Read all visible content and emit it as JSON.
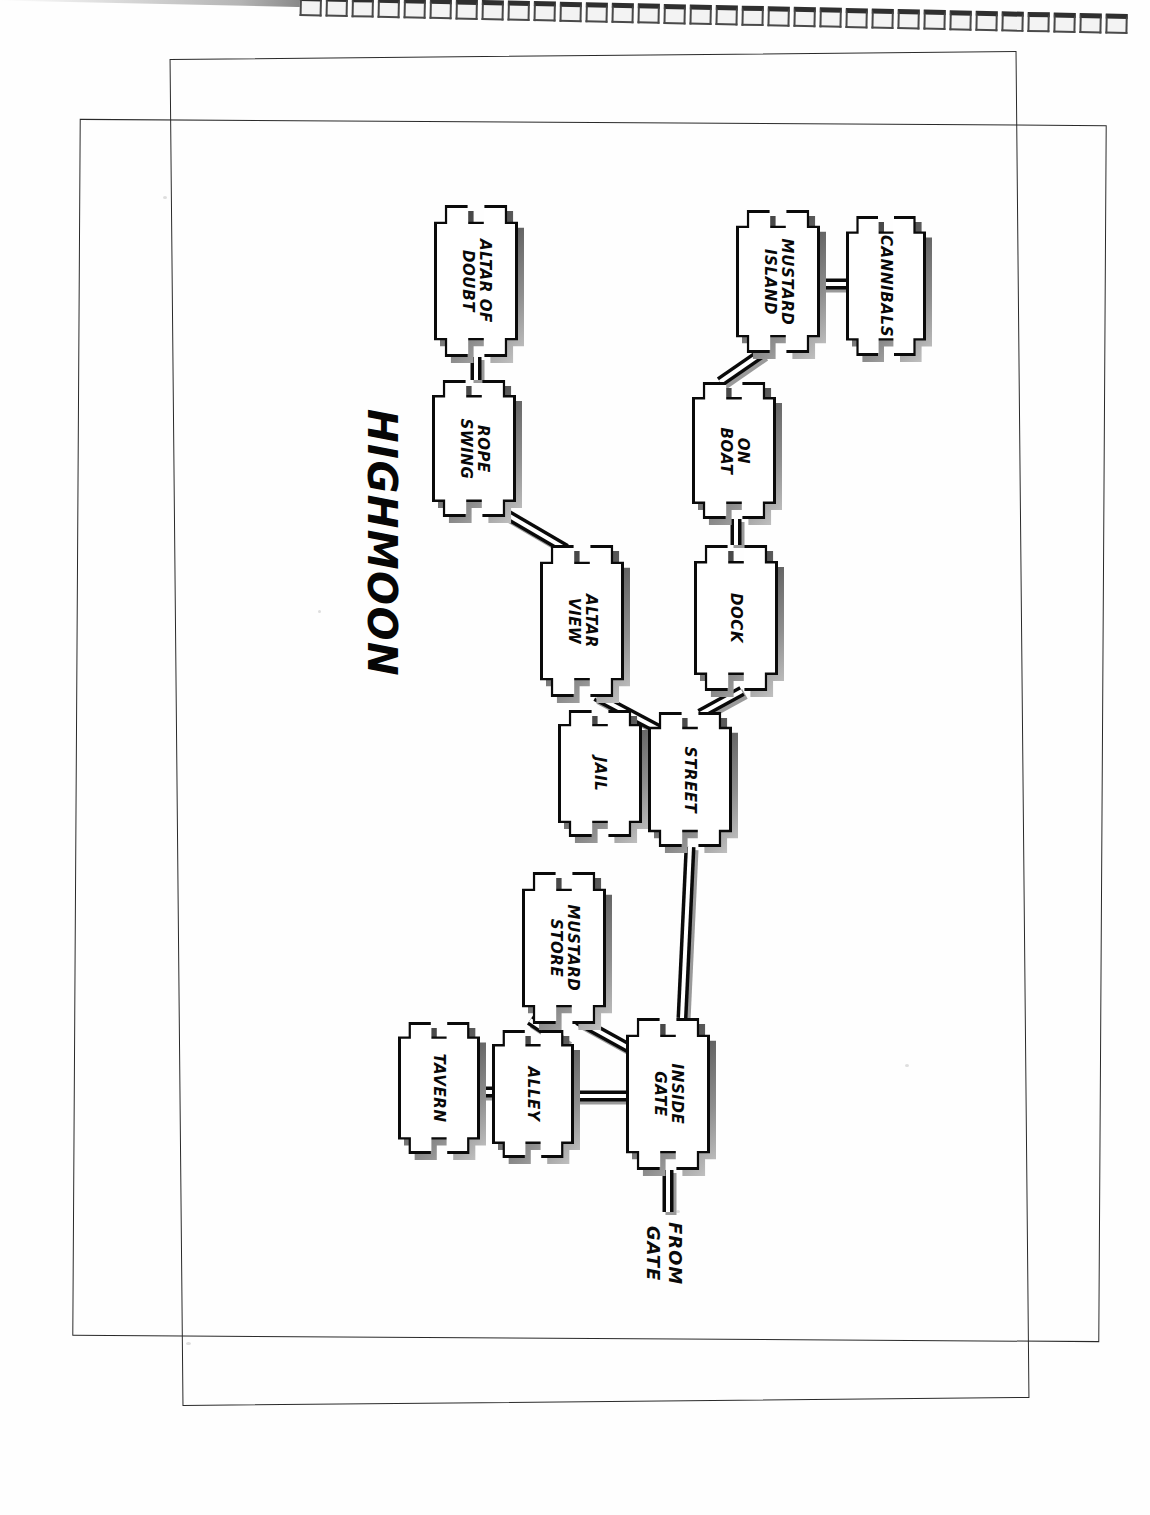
{
  "document": {
    "title": "HIGHMOON",
    "kind": "hand-drawn location map (scanned page, rotated 90 degrees)"
  },
  "map": {
    "title": "HIGHMOON",
    "entry_label": "FROM\nGATE",
    "entry_label_line1": "FROM",
    "entry_label_line2": "GATE",
    "nodes": [
      {
        "id": "altar-of-doubt",
        "label": "ALTAR OF DOUBT",
        "line1": "ALTAR OF",
        "line2": "DOUBT",
        "x": 434,
        "y": 205,
        "w": 84,
        "h": 152
      },
      {
        "id": "rope-swing",
        "label": "ROPE SWING",
        "line1": "ROPE",
        "line2": "SWING",
        "x": 432,
        "y": 380,
        "w": 84,
        "h": 137
      },
      {
        "id": "altar-view",
        "label": "ALTAR VIEW",
        "line1": "ALTAR",
        "line2": "VIEW",
        "x": 540,
        "y": 545,
        "w": 84,
        "h": 152
      },
      {
        "id": "jail",
        "label": "JAIL",
        "line1": "JAIL",
        "line2": "",
        "x": 558,
        "y": 710,
        "w": 84,
        "h": 127
      },
      {
        "id": "street",
        "label": "STREET",
        "line1": "STREET",
        "line2": "",
        "x": 648,
        "y": 712,
        "w": 84,
        "h": 135
      },
      {
        "id": "dock",
        "label": "DOCK",
        "line1": "DOCK",
        "line2": "",
        "x": 694,
        "y": 545,
        "w": 84,
        "h": 146
      },
      {
        "id": "on-boat",
        "label": "ON BOAT",
        "line1": "ON",
        "line2": "BOAT",
        "x": 692,
        "y": 382,
        "w": 84,
        "h": 137
      },
      {
        "id": "mustard-island",
        "label": "MUSTARD ISLAND",
        "line1": "MUSTARD",
        "line2": "ISLAND",
        "x": 736,
        "y": 210,
        "w": 84,
        "h": 143
      },
      {
        "id": "cannibals",
        "label": "CANNIBALS",
        "line1": "CANNIBALS",
        "line2": "",
        "x": 846,
        "y": 216,
        "w": 80,
        "h": 140
      },
      {
        "id": "mustard-store",
        "label": "MUSTARD STORE",
        "line1": "MUSTARD",
        "line2": "STORE",
        "x": 522,
        "y": 872,
        "w": 84,
        "h": 152
      },
      {
        "id": "tavern",
        "label": "TAVERN",
        "line1": "TAVERN",
        "line2": "",
        "x": 398,
        "y": 1022,
        "w": 82,
        "h": 132
      },
      {
        "id": "alley",
        "label": "ALLEY",
        "line1": "ALLEY",
        "line2": "",
        "x": 492,
        "y": 1030,
        "w": 82,
        "h": 128
      },
      {
        "id": "inside-gate",
        "label": "INSIDE GATE",
        "line1": "INSIDE",
        "line2": "GATE",
        "x": 626,
        "y": 1018,
        "w": 84,
        "h": 152
      }
    ],
    "edges": [
      {
        "id": "edge-altar-of-doubt-rope-swing",
        "from": "ALTAR OF DOUBT",
        "to": "ROPE SWING",
        "x1": 476,
        "y1": 357,
        "x2": 476,
        "y2": 380
      },
      {
        "id": "edge-rope-swing-altar-view",
        "from": "ROPE SWING",
        "to": "ALTAR VIEW",
        "x1": 506,
        "y1": 514,
        "x2": 566,
        "y2": 549
      },
      {
        "id": "edge-altar-view-street",
        "from": "ALTAR VIEW",
        "to": "STREET",
        "x1": 596,
        "y1": 696,
        "x2": 660,
        "y2": 730
      },
      {
        "id": "edge-jail-street",
        "from": "JAIL",
        "to": "STREET",
        "x1": 642,
        "y1": 778,
        "x2": 648,
        "y2": 778
      },
      {
        "id": "edge-street-dock",
        "from": "STREET",
        "to": "DOCK",
        "x1": 700,
        "y1": 714,
        "x2": 742,
        "y2": 691
      },
      {
        "id": "edge-dock-on-boat",
        "from": "DOCK",
        "to": "ON BOAT",
        "x1": 736,
        "y1": 545,
        "x2": 736,
        "y2": 519
      },
      {
        "id": "edge-on-boat-mustard-island",
        "from": "ON BOAT",
        "to": "MUSTARD ISLAND",
        "x1": 720,
        "y1": 382,
        "x2": 762,
        "y2": 353
      },
      {
        "id": "edge-mustard-island-cannibals",
        "from": "MUSTARD ISLAND",
        "to": "CANNIBALS",
        "x1": 820,
        "y1": 284,
        "x2": 846,
        "y2": 284
      },
      {
        "id": "edge-street-inside-gate",
        "from": "STREET",
        "to": "INSIDE GATE",
        "x1": 690,
        "y1": 847,
        "x2": 682,
        "y2": 1018
      },
      {
        "id": "edge-mustard-store-inside-gate",
        "from": "MUSTARD STORE",
        "to": "INSIDE GATE",
        "x1": 578,
        "y1": 1020,
        "x2": 636,
        "y2": 1052
      },
      {
        "id": "edge-mustard-store-alley",
        "from": "MUSTARD STORE",
        "to": "ALLEY",
        "x1": 530,
        "y1": 1020,
        "x2": 566,
        "y2": 1044
      },
      {
        "id": "edge-alley-inside-gate",
        "from": "ALLEY",
        "to": "INSIDE GATE",
        "x1": 574,
        "y1": 1096,
        "x2": 626,
        "y2": 1096
      },
      {
        "id": "edge-tavern-alley",
        "from": "TAVERN",
        "to": "ALLEY",
        "x1": 480,
        "y1": 1092,
        "x2": 492,
        "y2": 1092
      },
      {
        "id": "edge-inside-gate-from-gate",
        "from": "INSIDE GATE",
        "to": "FROM GATE",
        "x1": 668,
        "y1": 1170,
        "x2": 668,
        "y2": 1212
      }
    ]
  },
  "colors": {
    "ink": "#0a0a0a",
    "paper": "#ffffff",
    "shadow_dark": "#3a3a3a",
    "shadow_light": "#c9c9c9",
    "frame_line": "#2a2a2a"
  }
}
